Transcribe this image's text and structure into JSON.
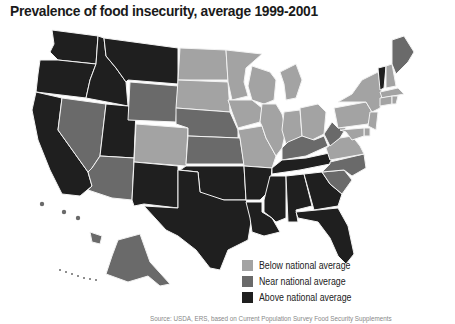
{
  "title": "Prevalence of food insecurity, average 1999-2001",
  "colors": {
    "below": "#a3a3a3",
    "near": "#6a6a6a",
    "above": "#1f1f1f",
    "border": "#f2f2f2",
    "background": "#ffffff"
  },
  "legend": [
    {
      "key": "below",
      "label": "Below national average"
    },
    {
      "key": "near",
      "label": "Near national average"
    },
    {
      "key": "above",
      "label": "Above national average"
    }
  ],
  "categories": {
    "above": [
      "WA",
      "OR",
      "CA",
      "ID",
      "MT",
      "UT",
      "NM",
      "TX",
      "OK",
      "AR",
      "LA",
      "MS",
      "AL",
      "TN",
      "GA",
      "FL",
      "VT"
    ],
    "near": [
      "NV",
      "AZ",
      "WY",
      "NE",
      "KS",
      "KY",
      "WV",
      "NC",
      "SC",
      "ME",
      "AK",
      "HI"
    ],
    "below": [
      "ND",
      "SD",
      "CO",
      "MN",
      "IA",
      "MO",
      "WI",
      "IL",
      "MI",
      "IN",
      "OH",
      "PA",
      "NY",
      "VA",
      "NH",
      "MA",
      "CT",
      "RI",
      "NJ",
      "DE",
      "MD"
    ]
  },
  "footnote": "Source: USDA, ERS, based on Current Population Survey Food Security Supplements"
}
